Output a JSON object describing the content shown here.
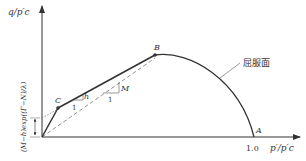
{
  "diagram": {
    "y_axis_label": "q/p′c",
    "x_axis_label": "p′/p′c",
    "x_tick_label": "1.0",
    "points": {
      "A": "A",
      "B": "B",
      "C": "C"
    },
    "yield_surface_label": "屈服面",
    "slope_h": "h",
    "slope_M": "M",
    "run_one_a": "1",
    "run_one_b": "1",
    "intercept_label": "(M−h)exp((Γ−N)/λ)",
    "colors": {
      "line": "#333333",
      "dashed": "#777777"
    }
  }
}
